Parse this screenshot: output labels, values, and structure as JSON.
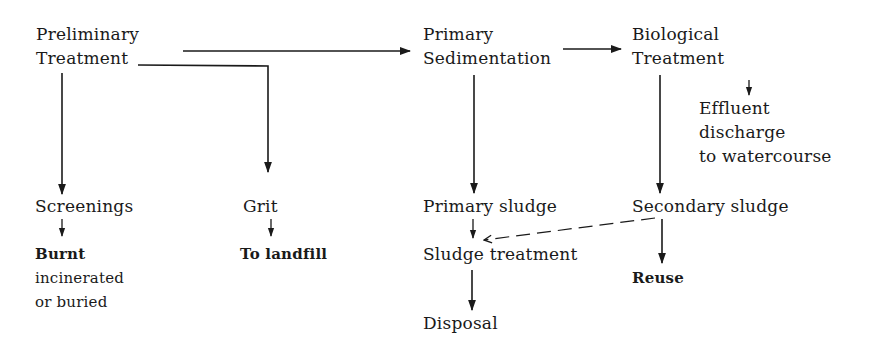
{
  "diagram": {
    "nodes": {
      "preliminary_treatment": [
        "Preliminary",
        "Treatment"
      ],
      "primary_sedimentation": [
        "Primary",
        "Sedimentation"
      ],
      "biological_treatment": [
        "Biological",
        "Treatment"
      ],
      "effluent": [
        "Effluent",
        "discharge",
        "to watercourse"
      ],
      "screenings": "Screenings",
      "screenings_fate": [
        "Burnt",
        "incinerated",
        "or buried"
      ],
      "grit": "Grit",
      "grit_fate": "To landfill",
      "primary_sludge": "Primary sludge",
      "secondary_sludge": "Secondary sludge",
      "sludge_treatment": "Sludge treatment",
      "disposal": "Disposal",
      "reuse": "Reuse"
    },
    "edges": [
      {
        "from": "Preliminary Treatment",
        "to": "Primary Sedimentation",
        "style": "solid"
      },
      {
        "from": "Preliminary Treatment",
        "to": "Screenings",
        "style": "solid"
      },
      {
        "from": "Preliminary Treatment",
        "to": "Grit",
        "style": "solid"
      },
      {
        "from": "Primary Sedimentation",
        "to": "Biological Treatment",
        "style": "solid"
      },
      {
        "from": "Biological Treatment",
        "to": "Effluent discharge to watercourse",
        "style": "solid"
      },
      {
        "from": "Primary Sedimentation",
        "to": "Primary sludge",
        "style": "solid"
      },
      {
        "from": "Biological Treatment",
        "to": "Secondary sludge",
        "style": "solid"
      },
      {
        "from": "Screenings",
        "to": "Burnt incinerated or buried",
        "style": "solid"
      },
      {
        "from": "Grit",
        "to": "To landfill",
        "style": "solid"
      },
      {
        "from": "Primary sludge",
        "to": "Sludge treatment",
        "style": "solid"
      },
      {
        "from": "Secondary sludge",
        "to": "Sludge treatment",
        "style": "dashed"
      },
      {
        "from": "Secondary sludge",
        "to": "Reuse",
        "style": "solid"
      },
      {
        "from": "Sludge treatment",
        "to": "Disposal",
        "style": "solid"
      }
    ],
    "colors": {
      "line": "#1a1a1a",
      "background": "#ffffff"
    }
  }
}
